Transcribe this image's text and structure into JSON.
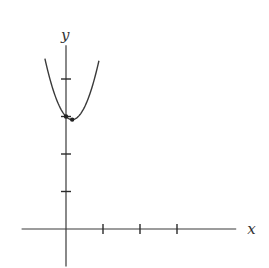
{
  "axes": {
    "x_label": "x",
    "y_label": "y",
    "origin_px": [
      66,
      229
    ],
    "unit_px": {
      "x": 37,
      "y": 37.5
    },
    "x_range_units": [
      -1.2,
      4.6
    ],
    "y_range_units": [
      -1.0,
      4.9
    ],
    "x_ticks": [
      1,
      2,
      3
    ],
    "y_ticks": [
      1,
      2,
      3,
      4
    ]
  },
  "curve": {
    "type": "parabola",
    "equation": "y = 3x^2 - x + 3",
    "a": 3,
    "b": -1,
    "c": 3,
    "x_domain": [
      -0.57,
      0.89
    ],
    "color": "#3a3a3a"
  },
  "points": [
    {
      "name": "y-intercept",
      "x": 0,
      "y": 3
    },
    {
      "name": "vertex",
      "x": 0.1667,
      "y": 2.917
    }
  ],
  "chart_data": {
    "type": "line",
    "title": "",
    "xlabel": "x",
    "ylabel": "y",
    "grid": false,
    "legend": null,
    "x_ticks": [
      1,
      2,
      3
    ],
    "y_ticks": [
      1,
      2,
      3,
      4
    ],
    "series": [
      {
        "name": "parabola",
        "x": [
          -0.57,
          -0.4,
          -0.2,
          0,
          0.1667,
          0.4,
          0.6,
          0.89
        ],
        "y": [
          4.54,
          3.88,
          3.32,
          3.0,
          2.92,
          3.08,
          3.48,
          4.49
        ]
      }
    ],
    "annotations": [
      {
        "x": 0,
        "y": 3,
        "marker": "dot"
      },
      {
        "x": 0.1667,
        "y": 2.917,
        "marker": "dot"
      }
    ],
    "xlim": [
      -1.2,
      4.6
    ],
    "ylim": [
      -1.0,
      4.9
    ]
  }
}
